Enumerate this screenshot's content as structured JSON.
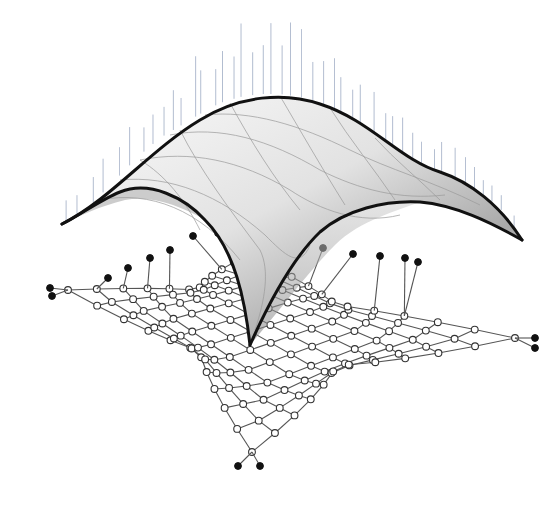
{
  "figure": {
    "colors": {
      "background": "#ffffff",
      "surface_light": "#f2f2f2",
      "surface_dark": "#8a8a8a",
      "surface_outline": "#111111",
      "force_lines": "#7d8fb0",
      "grid_edges": "#555555",
      "free_node_fill": "#ffffff",
      "fixed_node_fill": "#111111"
    },
    "surface": {
      "label": "",
      "corners": 4,
      "has_vertical_force_lines": true
    },
    "network": {
      "label": "",
      "free_node_style": "hollow-circle",
      "support_node_style": "filled-circle",
      "support_groups": [
        "left",
        "top",
        "right",
        "bottom"
      ]
    }
  }
}
